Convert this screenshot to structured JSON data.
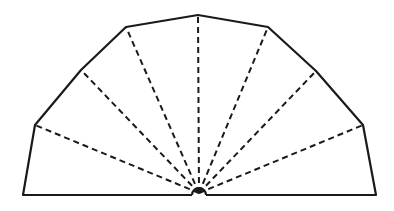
{
  "diagram": {
    "type": "polygonal-fan-net",
    "colors": {
      "stroke": "#1a1a1a",
      "background": "#ffffff"
    },
    "apex": [
      199,
      193
    ],
    "outline": [
      [
        23,
        195
      ],
      [
        35,
        125
      ],
      [
        81,
        70
      ],
      [
        126,
        27
      ],
      [
        198,
        15
      ],
      [
        268,
        27
      ],
      [
        316,
        71
      ],
      [
        363,
        125
      ],
      [
        376,
        195
      ]
    ],
    "dashed_rays_to": [
      [
        35,
        125
      ],
      [
        81,
        70
      ],
      [
        126,
        27
      ],
      [
        198,
        15
      ],
      [
        268,
        27
      ],
      [
        316,
        71
      ],
      [
        363,
        125
      ]
    ],
    "sector_count": 8
  }
}
